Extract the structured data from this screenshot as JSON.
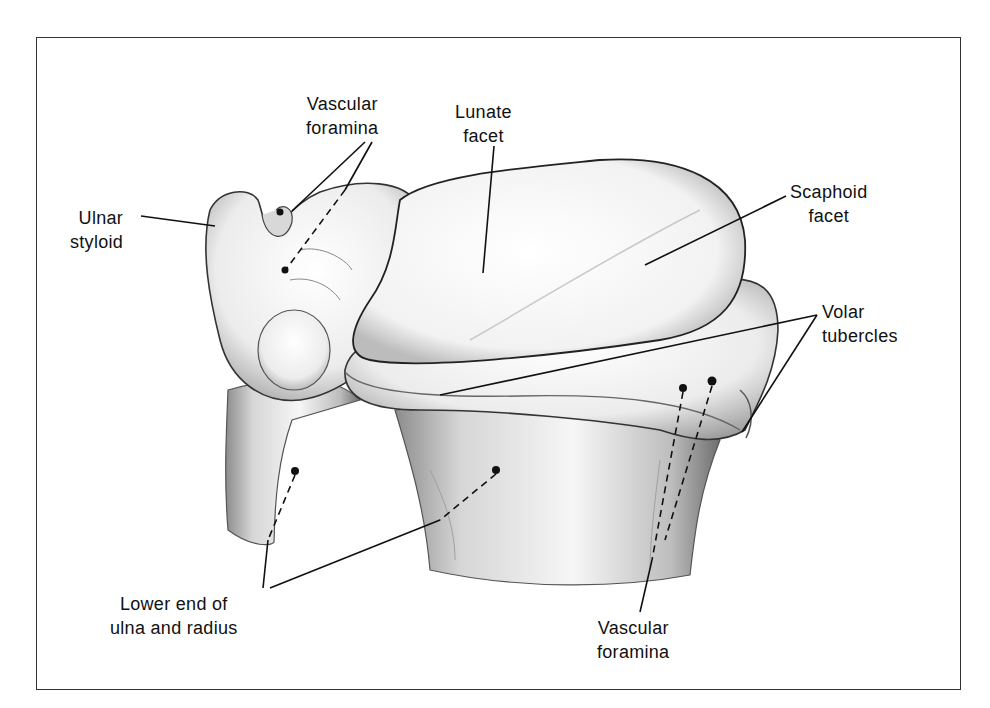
{
  "figure": {
    "border_color": "#333333",
    "ink_color": "#111111"
  },
  "labels": {
    "vascular_foramina_top": {
      "line1": "Vascular",
      "line2": "foramina"
    },
    "lunate_facet": {
      "line1": "Lunate",
      "line2": "facet"
    },
    "ulnar_styloid": {
      "line1": "Ulnar",
      "line2": "styloid"
    },
    "scaphoid_facet": {
      "line1": "Scaphoid",
      "line2": "facet"
    },
    "volar_tubercles": {
      "line1": "Volar",
      "line2": "tubercles"
    },
    "lower_end": {
      "line1": "Lower end of",
      "line2": "ulna and radius"
    },
    "vascular_foramina_bottom": {
      "line1": "Vascular",
      "line2": "foramina"
    }
  }
}
